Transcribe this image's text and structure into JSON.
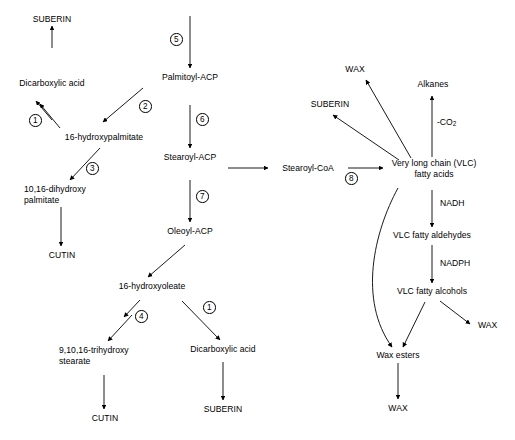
{
  "diagram": {
    "type": "pathway-flowchart",
    "background_color": "#ffffff",
    "line_color": "#000000",
    "text_color": "#000000"
  },
  "nodes": {
    "suberin_top_left": "SUBERIN",
    "dicarboxylic_acid_left": "Dicarboxylic acid",
    "hydroxypalmitate": "16-hydroxypalmitate",
    "dihydroxypalmitate_l1": "10,16-dihydroxy",
    "dihydroxypalmitate_l2": "palmitate",
    "cutin_left": "CUTIN",
    "palmitoyl_acp": "Palmitoyl-ACP",
    "stearoyl_acp": "Stearoyl-ACP",
    "oleoyl_acp": "Oleoyl-ACP",
    "hydroxyoleate": "16-hydroxyoleate",
    "trihydroxystearate_l1": "9,10,16-trihydroxy",
    "trihydroxystearate_l2": "stearate",
    "cutin_bottom": "CUTIN",
    "dicarboxylic_acid_bottom": "Dicarboxylic acid",
    "suberin_bottom": "SUBERIN",
    "stearoyl_coa": "Stearoyl-CoA",
    "wax_top_right": "WAX",
    "suberin_right": "SUBERIN",
    "alkanes": "Alkanes",
    "vlc_fatty_acids_l1": "Very long chain (VLC)",
    "vlc_fatty_acids_l2": "fatty acids",
    "vlc_fatty_aldehydes": "VLC fatty aldehydes",
    "vlc_fatty_alcohols": "VLC fatty alcohols",
    "wax_esters": "Wax esters",
    "wax_right": "WAX",
    "wax_bottom": "WAX"
  },
  "enzyme_steps": {
    "step1_left": "1",
    "step2": "2",
    "step3": "3",
    "step4": "4",
    "step5": "5",
    "step6": "6",
    "step7": "7",
    "step1_bottom": "1",
    "step8": "8"
  },
  "cofactors": {
    "co2_prefix": "-CO",
    "co2_subscript": "2",
    "nadh": "NADH",
    "nadph": "NADPH"
  }
}
